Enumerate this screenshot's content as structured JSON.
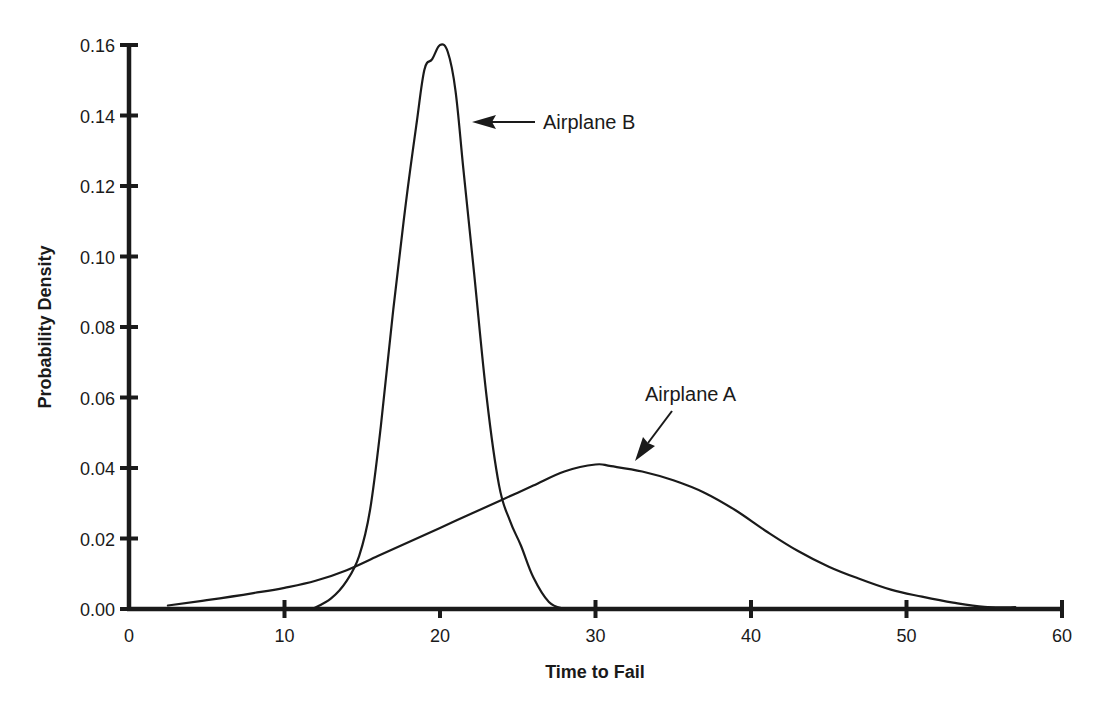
{
  "chart_data": {
    "type": "line",
    "title": "",
    "xlabel": "Time to Fail",
    "ylabel": "Probability Density",
    "xlim": [
      0,
      60
    ],
    "ylim": [
      0,
      0.16
    ],
    "grid": false,
    "legend": "none (inline arrow annotations)",
    "x_ticks": [
      "0",
      "10",
      "20",
      "30",
      "40",
      "50",
      "60"
    ],
    "y_ticks": [
      "0.00",
      "0.02",
      "0.04",
      "0.06",
      "0.08",
      "0.10",
      "0.12",
      "0.14",
      "0.16"
    ],
    "series": [
      {
        "name": "Airplane A",
        "x": [
          2.5,
          5,
          8,
          10,
          12,
          14,
          16,
          18,
          20,
          22,
          24,
          26,
          28,
          30,
          31,
          33,
          35,
          37,
          39,
          41,
          43,
          45,
          47,
          49,
          51,
          53,
          55,
          57
        ],
        "values": [
          0.001,
          0.0025,
          0.0045,
          0.006,
          0.008,
          0.011,
          0.015,
          0.019,
          0.023,
          0.027,
          0.031,
          0.035,
          0.039,
          0.041,
          0.0405,
          0.039,
          0.0365,
          0.033,
          0.028,
          0.022,
          0.0165,
          0.012,
          0.0085,
          0.0055,
          0.0035,
          0.0018,
          0.0006,
          0.0005
        ]
      },
      {
        "name": "Airplane B",
        "x": [
          11.8,
          13,
          14,
          14.8,
          15.5,
          16.2,
          17,
          17.8,
          18.5,
          19,
          19.5,
          20,
          20.5,
          21,
          21.5,
          22.2,
          23,
          23.8,
          24.5,
          25.2,
          26,
          27,
          28
        ],
        "values": [
          0.0,
          0.003,
          0.008,
          0.015,
          0.028,
          0.052,
          0.085,
          0.115,
          0.138,
          0.153,
          0.156,
          0.16,
          0.158,
          0.147,
          0.125,
          0.095,
          0.06,
          0.035,
          0.025,
          0.018,
          0.009,
          0.002,
          0.0
        ]
      }
    ],
    "annotations": [
      {
        "text": "Airplane B",
        "points_to": "Airplane B",
        "arrow": "horizontal, pointing left toward right flank of B curve near y=0.14"
      },
      {
        "text": "Airplane A",
        "points_to": "Airplane A",
        "arrow": "diagonal, pointing down-left toward A curve near x=32"
      }
    ]
  },
  "labels": {
    "annotation_b": "Airplane B",
    "annotation_a": "Airplane A"
  },
  "colors": {
    "background": "#ffffff",
    "ink": "#1a1a1a"
  }
}
